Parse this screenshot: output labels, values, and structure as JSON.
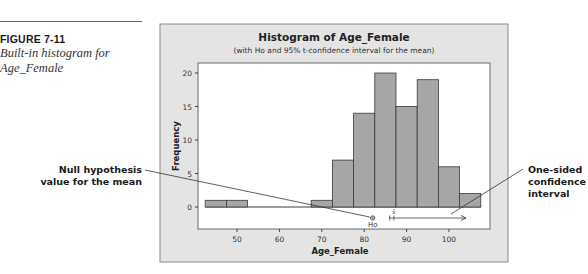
{
  "figure": {
    "label": "FIGURE 7-11",
    "caption": "Built-in histogram for Age_Female"
  },
  "callouts": {
    "left": "Null hypothesis value for the mean",
    "right": "One-sided confidence interval"
  },
  "chart_data": {
    "type": "bar",
    "title": "Histogram of Age_Female",
    "subtitle": "(with Ho and 95% t-confidence interval for the mean)",
    "xlabel": "Age_Female",
    "ylabel": "Frequency",
    "x_ticks": [
      50,
      60,
      70,
      80,
      90,
      100
    ],
    "y_ticks": [
      0,
      5,
      10,
      15,
      20
    ],
    "bin_width": 5,
    "categories": [
      "42.5-47.5",
      "47.5-52.5",
      "52.5-57.5",
      "57.5-62.5",
      "62.5-67.5",
      "67.5-72.5",
      "72.5-77.5",
      "77.5-82.5",
      "82.5-87.5",
      "87.5-92.5",
      "92.5-97.5",
      "97.5-102.5",
      "102.5-107.5"
    ],
    "bin_starts": [
      42.5,
      47.5,
      52.5,
      57.5,
      62.5,
      67.5,
      72.5,
      77.5,
      82.5,
      87.5,
      92.5,
      97.5,
      102.5
    ],
    "values": [
      1,
      1,
      0,
      0,
      0,
      1,
      7,
      14,
      20,
      15,
      19,
      6,
      2
    ],
    "annotations": {
      "ho_label": "Ho",
      "ho_value": 82,
      "xbar_label": "x̄",
      "xbar_value": 87,
      "ci_lower": 86,
      "ci_direction": "upper (one-sided, arrow to right)"
    },
    "ylim": [
      0,
      21
    ],
    "xlim": [
      41,
      108
    ],
    "grid": false,
    "legend": "none"
  },
  "colors": {
    "panel_bg": "#e4e4e4",
    "plot_bg": "#ffffff",
    "bar_fill": "#a6a6a6",
    "bar_edge": "#3a3a3a",
    "axis": "#444444"
  }
}
